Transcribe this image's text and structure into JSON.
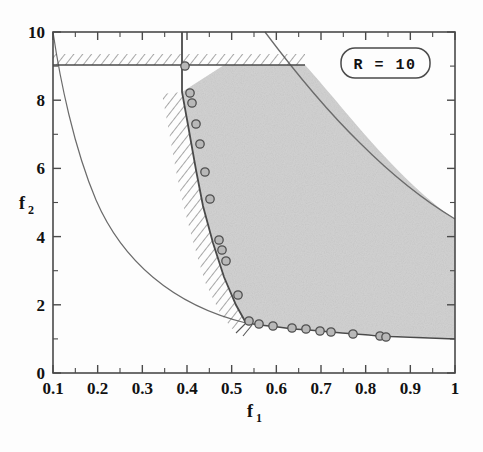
{
  "figure": {
    "background_color": "#fdfdfd",
    "frame_color": "#4a4a4a",
    "annotation": {
      "label": "R  =  10",
      "box": "rounded-rectangle"
    }
  },
  "chart_data": {
    "type": "line",
    "title": "",
    "subtitle": "",
    "xlabel": "f",
    "xlabel_sub": "1",
    "ylabel": "f",
    "ylabel_sub": "2",
    "xlim": [
      0.1,
      1.0
    ],
    "ylim": [
      0,
      10
    ],
    "xticks": [
      0.1,
      0.2,
      0.3,
      0.4,
      0.5,
      0.6,
      0.7,
      0.8,
      0.9,
      1.0
    ],
    "xtick_labels": [
      "0.1",
      "0.2",
      "0.3",
      "0.4",
      "0.5",
      "0.6",
      "0.7",
      "0.8",
      "0.9",
      "1"
    ],
    "yticks": [
      0,
      2,
      4,
      6,
      8,
      10
    ],
    "ytick_labels": [
      "0",
      "2",
      "4",
      "6",
      "8",
      "10"
    ],
    "x_minor_per_interval": 1,
    "y_minor_per_interval": 1,
    "grid": false,
    "legend": null,
    "annotations": [
      {
        "text": "R  =  10",
        "x": 0.78,
        "y": 9.15,
        "style": "rounded-box"
      }
    ],
    "series": [
      {
        "name": "upper-bound-hatched-line",
        "type": "line",
        "style": "solid-with-hatching-above",
        "comment": "horizontal constraint line at f2 = 9.1 from f1=0.1 to its intersection with the stability boundary",
        "x": [
          0.1,
          0.585
        ],
        "values": [
          9.1,
          9.1
        ]
      },
      {
        "name": "left-stability-boundary",
        "type": "line",
        "style": "solid-with-hatching-left",
        "comment": "steep descending boundary with circular data markers; hatching on its left (outside) side",
        "x": [
          0.383,
          0.408,
          0.44,
          0.452,
          0.47,
          0.49,
          0.512,
          0.53,
          0.552,
          0.572,
          0.59,
          0.612,
          0.64,
          0.66
        ],
        "values": [
          10.0,
          9.1,
          8.3,
          8.0,
          7.4,
          6.8,
          6.0,
          5.2,
          4.0,
          3.4,
          3.0,
          2.4,
          1.7,
          1.45
        ]
      },
      {
        "name": "lower-stability-boundary",
        "type": "line",
        "style": "solid-with-markers",
        "comment": "shallow descending lower boundary of the shaded region, from the kink at f1 = 0.66 to f1 = 1",
        "x": [
          0.66,
          0.69,
          0.73,
          0.765,
          0.8,
          0.825,
          0.875,
          0.935,
          0.955,
          1.0
        ],
        "values": [
          1.45,
          1.4,
          1.32,
          1.28,
          1.22,
          1.19,
          1.13,
          1.07,
          1.05,
          1.0
        ]
      },
      {
        "name": "upper-right-boundary-curve",
        "type": "line",
        "style": "thin-solid",
        "comment": "smooth curve bounding the shaded region on the upper right, descending from f2=10 to f2=6 at f1=1",
        "x": [
          0.575,
          0.6,
          0.63,
          0.67,
          0.71,
          0.75,
          0.79,
          0.83,
          0.87,
          0.91,
          0.95,
          1.0
        ],
        "values": [
          10.0,
          9.55,
          9.05,
          8.45,
          7.9,
          7.45,
          7.05,
          6.75,
          6.5,
          6.3,
          6.12,
          6.0
        ]
      },
      {
        "name": "lower-left-thin-curve",
        "type": "line",
        "style": "thin-solid",
        "comment": "hyperbola-like unshaded curve from (0.1, 10) decaying to meet the boundary near f1 = 0.66",
        "x": [
          0.1,
          0.12,
          0.145,
          0.175,
          0.21,
          0.25,
          0.3,
          0.35,
          0.4,
          0.45,
          0.5,
          0.56,
          0.61,
          0.66
        ],
        "values": [
          10.0,
          8.6,
          7.3,
          6.1,
          5.05,
          4.2,
          3.4,
          2.85,
          2.45,
          2.15,
          1.92,
          1.72,
          1.58,
          1.45
        ]
      },
      {
        "name": "data-markers-left-branch",
        "type": "scatter",
        "marker": "open-circle-gray-fill",
        "x": [
          0.408,
          0.44,
          0.452,
          0.47,
          0.49,
          0.512,
          0.53,
          0.552,
          0.558,
          0.572,
          0.612,
          0.645
        ],
        "values": [
          9.1,
          8.3,
          8.0,
          7.4,
          6.8,
          6.0,
          5.2,
          4.0,
          3.7,
          3.4,
          2.4,
          1.62
        ]
      },
      {
        "name": "data-markers-lower-branch",
        "type": "scatter",
        "marker": "open-circle-gray-fill",
        "x": [
          0.668,
          0.7,
          0.742,
          0.775,
          0.805,
          0.828,
          0.878,
          0.938,
          0.952
        ],
        "values": [
          1.44,
          1.38,
          1.31,
          1.27,
          1.22,
          1.19,
          1.13,
          1.07,
          1.05
        ]
      }
    ],
    "shaded_region": {
      "name": "stable-region",
      "fill_color": "#d2d2d2",
      "texture": "fine-noise",
      "description": "region bounded left by the stability boundary, above by f2=9.1 line and the upper-right curve, below by the lower boundary"
    }
  }
}
